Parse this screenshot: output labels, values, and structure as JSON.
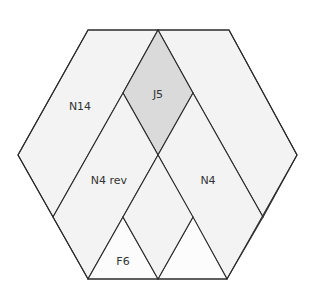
{
  "diagram": {
    "type": "hexagon-quilt-block",
    "colors": {
      "outline": "#2a2a2a",
      "light_piece": "#f3f3f3",
      "dark_piece": "#dadada",
      "white_piece": "#fcfcfc",
      "label": "#333333"
    },
    "pieces": [
      {
        "id": "N14",
        "label": "N14",
        "label_pos": [
          80,
          106
        ]
      },
      {
        "id": "J5",
        "label": "J5",
        "label_pos": [
          158,
          94
        ]
      },
      {
        "id": "N4rev",
        "label": "N4 rev",
        "label_pos": [
          109,
          180
        ]
      },
      {
        "id": "N4",
        "label": "N4",
        "label_pos": [
          208,
          180
        ]
      },
      {
        "id": "F6",
        "label": "F6",
        "label_pos": [
          123,
          261
        ]
      }
    ]
  }
}
